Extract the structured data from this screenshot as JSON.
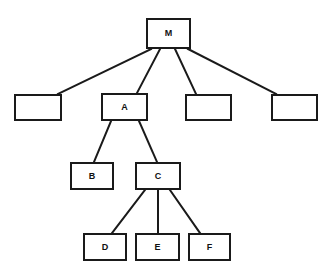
{
  "diagram": {
    "type": "tree",
    "title": "",
    "background_color": "#ffffff",
    "node_border_color": "#1a1a1a",
    "node_fill_color": "#ffffff",
    "edge_color": "#1a1a1a",
    "root": "M",
    "nodes": [
      {
        "id": "M",
        "label": "M",
        "x": 146,
        "y": 18,
        "w": 45,
        "h": 31,
        "level": 0
      },
      {
        "id": "N1",
        "label": "",
        "x": 14,
        "y": 94,
        "w": 48,
        "h": 27,
        "level": 1
      },
      {
        "id": "A",
        "label": "A",
        "x": 101,
        "y": 93,
        "w": 47,
        "h": 28,
        "level": 1
      },
      {
        "id": "N3",
        "label": "",
        "x": 185,
        "y": 94,
        "w": 47,
        "h": 27,
        "level": 1
      },
      {
        "id": "N4",
        "label": "",
        "x": 271,
        "y": 94,
        "w": 47,
        "h": 27,
        "level": 1
      },
      {
        "id": "B",
        "label": "B",
        "x": 70,
        "y": 162,
        "w": 44,
        "h": 28,
        "level": 2
      },
      {
        "id": "C",
        "label": "C",
        "x": 135,
        "y": 162,
        "w": 46,
        "h": 28,
        "level": 2
      },
      {
        "id": "D",
        "label": "D",
        "x": 83,
        "y": 233,
        "w": 44,
        "h": 28,
        "level": 3
      },
      {
        "id": "E",
        "label": "E",
        "x": 135,
        "y": 233,
        "w": 45,
        "h": 28,
        "level": 3
      },
      {
        "id": "F",
        "label": "F",
        "x": 188,
        "y": 233,
        "w": 43,
        "h": 28,
        "level": 3
      }
    ],
    "edges": [
      {
        "from": "M",
        "to": "N1",
        "x1": 151,
        "y1": 49,
        "x2": 58,
        "y2": 94
      },
      {
        "from": "M",
        "to": "A",
        "x1": 160,
        "y1": 49,
        "x2": 137,
        "y2": 93
      },
      {
        "from": "M",
        "to": "N3",
        "x1": 175,
        "y1": 49,
        "x2": 196,
        "y2": 94
      },
      {
        "from": "M",
        "to": "N4",
        "x1": 188,
        "y1": 49,
        "x2": 276,
        "y2": 94
      },
      {
        "from": "A",
        "to": "B",
        "x1": 111,
        "y1": 121,
        "x2": 94,
        "y2": 162
      },
      {
        "from": "A",
        "to": "C",
        "x1": 139,
        "y1": 121,
        "x2": 157,
        "y2": 162
      },
      {
        "from": "C",
        "to": "D",
        "x1": 145,
        "y1": 190,
        "x2": 112,
        "y2": 233
      },
      {
        "from": "C",
        "to": "E",
        "x1": 158,
        "y1": 190,
        "x2": 158,
        "y2": 233
      },
      {
        "from": "C",
        "to": "F",
        "x1": 170,
        "y1": 190,
        "x2": 200,
        "y2": 233
      }
    ]
  }
}
